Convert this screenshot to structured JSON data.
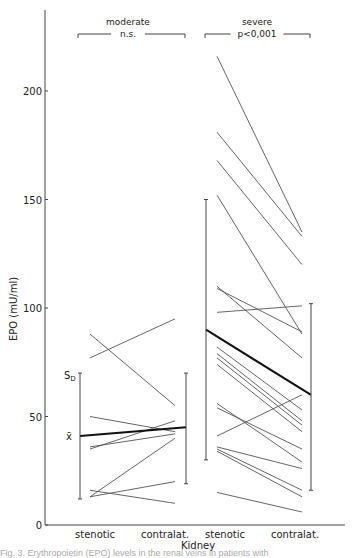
{
  "chart_data": {
    "type": "line",
    "title": "",
    "xlabel": "Kidney",
    "ylabel": "EPO (mU/ml)",
    "ylim": [
      0,
      225
    ],
    "yticks": [
      0,
      50,
      100,
      150,
      200
    ],
    "grid": false,
    "groups": [
      {
        "name": "moderate",
        "significance": "n.s.",
        "categories": [
          "stenotic",
          "contralat."
        ],
        "pairs": [
          [
            88,
            55
          ],
          [
            77,
            95
          ],
          [
            50,
            43
          ],
          [
            36,
            42
          ],
          [
            35,
            48
          ],
          [
            16,
            10
          ],
          [
            13,
            20
          ],
          [
            13,
            40
          ]
        ],
        "mean": [
          41,
          45
        ],
        "sd_range": {
          "stenotic": [
            12,
            70
          ],
          "contralat.": [
            19,
            70
          ]
        }
      },
      {
        "name": "severe",
        "significance": "p<0,001",
        "categories": [
          "stenotic",
          "contralat."
        ],
        "pairs": [
          [
            216,
            135
          ],
          [
            181,
            133
          ],
          [
            168,
            120
          ],
          [
            152,
            88
          ],
          [
            110,
            77
          ],
          [
            109,
            89
          ],
          [
            98,
            101
          ],
          [
            82,
            53
          ],
          [
            79,
            48
          ],
          [
            77,
            46
          ],
          [
            74,
            43
          ],
          [
            56,
            29
          ],
          [
            54,
            35
          ],
          [
            41,
            60
          ],
          [
            36,
            26
          ],
          [
            35,
            16
          ],
          [
            34,
            13
          ],
          [
            15,
            6
          ]
        ],
        "mean": [
          90,
          60
        ],
        "sd_range": {
          "stenotic": [
            30,
            150
          ],
          "contralat.": [
            16,
            102
          ]
        }
      }
    ],
    "annotations": {
      "sd_label": "S",
      "sd_sub": "D",
      "mean_label": "x̄"
    }
  },
  "caption": "Fig. 3. Erythropoietin (EPO) levels in the renal veins in patients with"
}
